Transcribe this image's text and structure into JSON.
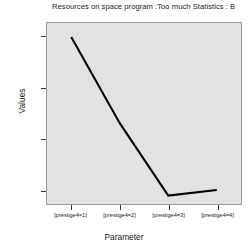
{
  "chart_data": {
    "type": "line",
    "title": "Resources on space program :Too much Statistics : B",
    "xlabel": "Parameter",
    "ylabel": "Values",
    "categories": [
      "[prestige4=1]",
      "[prestige4=2]",
      "[prestige4=3]",
      "[prestige4=4]"
    ],
    "values": [
      0.6,
      0.262,
      -0.022,
      0.0
    ],
    "series": [
      {
        "name": "Values",
        "values": [
          0.6,
          0.262,
          -0.022,
          0.0
        ]
      }
    ],
    "ylim": [
      -0.055,
      0.655
    ],
    "yticks": [
      0.0,
      0.2,
      0.4,
      0.6
    ],
    "ytick_labels": [
      "0.000",
      "0.200",
      "0.400",
      "0.600"
    ],
    "grid": false,
    "legend": "none",
    "line_color": "#000000",
    "plot_background": "#e2e2e2",
    "figure_background": "#ffffff"
  },
  "axes": {
    "y_label": "Values",
    "x_label": "Parameter"
  }
}
